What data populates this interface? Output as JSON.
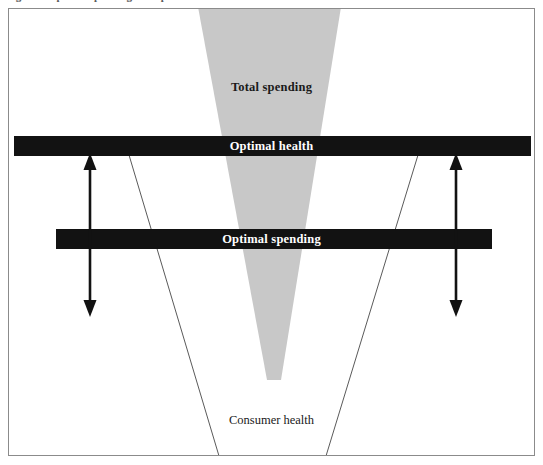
{
  "figure": {
    "caption_remnant": "Figure 1   Optimal spending and optimal health",
    "background_color": "#ffffff",
    "frame_border_color": "#8b8b8b"
  },
  "diagram": {
    "type": "conceptual-schematic",
    "elements": {
      "total_spending": {
        "label": "Total spending",
        "shape": "inverted-triangle-funnel",
        "fill_color": "#c8c8c8",
        "top_left_x": 189,
        "top_right_x": 332,
        "top_y": 5,
        "apex_x": 264,
        "apex_y": 371
      },
      "optimal_health": {
        "label": "Optimal health",
        "shape": "horizontal-bar",
        "fill_color": "#121212",
        "text_color": "#ffffff",
        "x": 5,
        "y": 127,
        "width": 517,
        "height": 20
      },
      "optimal_spending": {
        "label": "Optimal spending",
        "shape": "horizontal-bar",
        "fill_color": "#121212",
        "text_color": "#ffffff",
        "x": 47,
        "y": 220,
        "width": 436,
        "height": 20
      },
      "consumer_health": {
        "label": "Consumer health",
        "shape": "open-trapezoid-outline",
        "stroke_color": "#5a5a5a",
        "top_left_x": 120,
        "top_right_x": 409,
        "top_y": 147,
        "bottom_left_x": 210,
        "bottom_right_x": 317,
        "bottom_y": 447
      },
      "left_gap_arrow": {
        "name": "double-headed-arrow",
        "x": 81,
        "top_y": 147,
        "bottom_y": 305,
        "color": "#121212"
      },
      "right_gap_arrow": {
        "name": "double-headed-arrow",
        "x": 447,
        "top_y": 147,
        "bottom_y": 305,
        "color": "#121212"
      }
    }
  }
}
